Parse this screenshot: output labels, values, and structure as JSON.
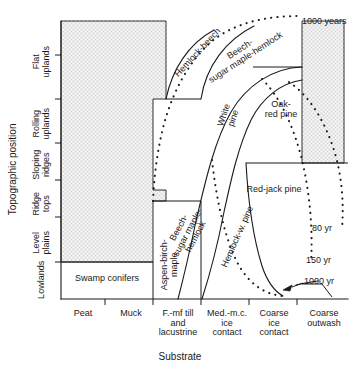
{
  "figure": {
    "type": "ecological-succession-diagram",
    "y_axis": {
      "title": "Topographic position",
      "categories": [
        "Lowlands",
        "Level plains",
        "Ridge tops",
        "Sloping ridges",
        "Rolling uplands",
        "Flat uplands"
      ]
    },
    "x_axis": {
      "title": "Substrate",
      "categories": [
        "Peat",
        "Muck",
        "F.-mf till and lacustrine",
        "Med.-m.c. ice contact",
        "Coarse ice contact",
        "Coarse outwash"
      ]
    },
    "vegetation_zones": [
      {
        "id": "swamp-conifers",
        "label": "Swamp conifers"
      },
      {
        "id": "aspen-birch-maple",
        "label": "Aspen-birch-maple"
      },
      {
        "id": "beech-sugar-maple-hemlock-lower",
        "label": "Beech-sugar maple-hemlock"
      },
      {
        "id": "hemlock-w-pine",
        "label": "Hemlock-w. pine"
      },
      {
        "id": "hemlock-beech",
        "label": "Hemlock-beech"
      },
      {
        "id": "beech-sugar-maple-hemlock-upper",
        "label": "Beech-sugar maple-hemlock"
      },
      {
        "id": "white-pine",
        "label": "White pine"
      },
      {
        "id": "oak-red-pine",
        "label": "Oak-red pine"
      },
      {
        "id": "red-jack-pine",
        "label": "Red-jack pine"
      }
    ],
    "age_isolines": [
      {
        "id": "age-1000-years-top",
        "label": "1000 years"
      },
      {
        "id": "age-80-yr",
        "label": "80 yr"
      },
      {
        "id": "age-150-yr",
        "label": "150 yr"
      },
      {
        "id": "age-1000-yr-bottom",
        "label": "1000 yr"
      }
    ],
    "colors": {
      "line": "#1a1a1a",
      "stipple": "#555555",
      "background": "#ffffff"
    }
  }
}
